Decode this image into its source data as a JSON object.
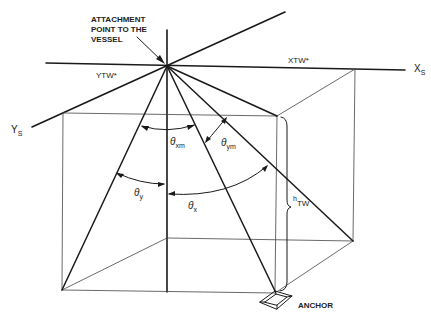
{
  "labels": {
    "attachment": [
      "ATTACHMENT",
      "POINT TO THE",
      "VESSEL"
    ],
    "ytw": "YTW*",
    "xtw": "XTW*",
    "xs_main": "X",
    "xs_sub": "S",
    "ys_main": "Y",
    "ys_sub": "S",
    "theta_xm_sub": "xm",
    "theta_ym_sub": "ym",
    "theta_y_sub": "y",
    "theta_x_sub": "x",
    "theta": "θ",
    "htw_main": "h",
    "htw_sub": "TW",
    "anchor": "ANCHOR"
  },
  "colors": {
    "line": "#1a1a1a",
    "thin": "#444444"
  }
}
